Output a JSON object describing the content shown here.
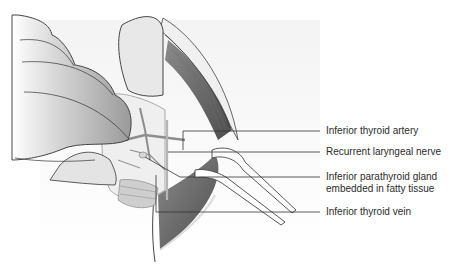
{
  "figure": {
    "labels": [
      {
        "id": "inferior-thyroid-artery",
        "text": "Inferior thyroid artery"
      },
      {
        "id": "recurrent-laryngeal-nerve",
        "text": "Recurrent laryngeal nerve"
      },
      {
        "id": "inferior-parathyroid-gland-1",
        "text": "Inferior parathyroid gland"
      },
      {
        "id": "inferior-parathyroid-gland-2",
        "text": "embedded in fatty tissue"
      },
      {
        "id": "inferior-thyroid-vein",
        "text": "Inferior thyroid vein"
      }
    ]
  }
}
